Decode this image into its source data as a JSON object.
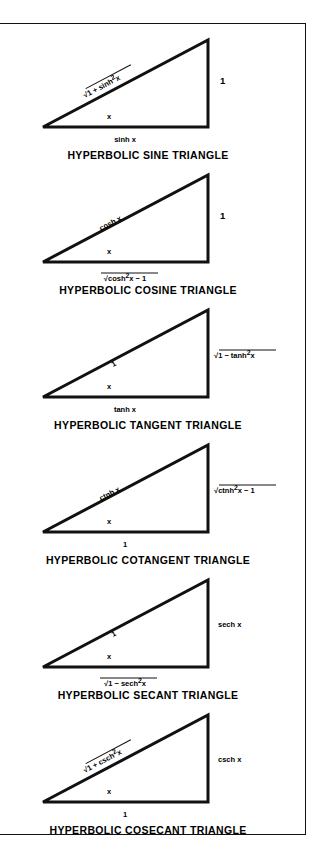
{
  "plate": {
    "title": "Hyperbolic function triangles reference plate",
    "figures": [
      {
        "id": "hyperbolic-sine",
        "caption": "HYPERBOLIC SINE TRIANGLE",
        "angle_label": "x",
        "hypotenuse": {
          "text": "√1 + sinh²x",
          "radicand": "1 + sinh",
          "exponent": "2",
          "var": "x",
          "rotated": true
        },
        "vertical": {
          "text": "1"
        },
        "base": {
          "text": "sinh x"
        }
      },
      {
        "id": "hyperbolic-cosine",
        "caption": "HYPERBOLIC COSINE TRIANGLE",
        "angle_label": "x",
        "hypotenuse": {
          "text": "cosh x",
          "rotated": true
        },
        "vertical": {
          "text": "1"
        },
        "base": {
          "text": "√cosh²x − 1",
          "radicand": "cosh",
          "exponent": "2",
          "var": "x − 1"
        }
      },
      {
        "id": "hyperbolic-tangent",
        "caption": "HYPERBOLIC TANGENT TRIANGLE",
        "angle_label": "x",
        "hypotenuse": {
          "text": "1",
          "rotated": true
        },
        "vertical": {
          "text": "√1 − tanh²x",
          "radicand": "1 − tanh",
          "exponent": "2",
          "var": "x"
        },
        "base": {
          "text": "tanh x"
        }
      },
      {
        "id": "hyperbolic-cotangent",
        "caption": "HYPERBOLIC COTANGENT TRIANGLE",
        "angle_label": "x",
        "hypotenuse": {
          "text": "ctnh x",
          "rotated": true
        },
        "vertical": {
          "text": "√ctnh²x − 1",
          "radicand": "ctnh",
          "exponent": "2",
          "var": "x − 1"
        },
        "base": {
          "text": "1"
        }
      },
      {
        "id": "hyperbolic-secant",
        "caption": "HYPERBOLIC SECANT TRIANGLE",
        "angle_label": "x",
        "hypotenuse": {
          "text": "1",
          "rotated": true
        },
        "vertical": {
          "text": "sech x"
        },
        "base": {
          "text": "√1 − sech²x",
          "radicand": "1 − sech",
          "exponent": "2",
          "var": "x"
        }
      },
      {
        "id": "hyperbolic-cosecant",
        "caption": "HYPERBOLIC COSECANT TRIANGLE",
        "angle_label": "x",
        "hypotenuse": {
          "text": "√1 + csch²x",
          "radicand": "1 + csch",
          "exponent": "2",
          "var": "x",
          "rotated": true
        },
        "vertical": {
          "text": "csch x"
        },
        "base": {
          "text": "1"
        }
      }
    ],
    "colors": {
      "ink": "#111111",
      "paper": "#ffffff"
    }
  }
}
